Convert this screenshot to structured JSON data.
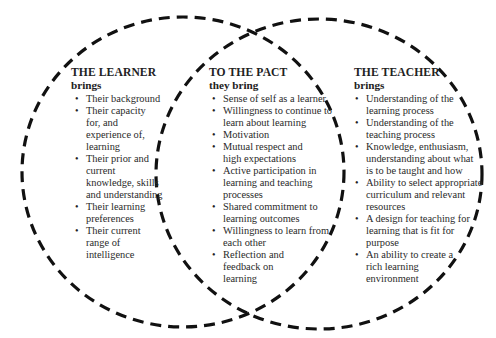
{
  "diagram": {
    "type": "venn",
    "circle_style": {
      "stroke": "#111111",
      "dash": "dashed"
    },
    "sets": [
      {
        "id": "learner",
        "title": "THE LEARNER",
        "subtitle": "brings",
        "items": [
          "Their background",
          "Their capacity for, and experience of, learning",
          "Their prior and current knowledge, skills and understanding",
          "Their learning preferences",
          "Their current range of intelligence"
        ]
      },
      {
        "id": "pact",
        "title": "TO THE PACT",
        "subtitle": "they bring",
        "items": [
          "Sense of self as a learner",
          "Willingness to continue to learn about learning",
          "Motivation",
          "Mutual respect and high expectations",
          "Active participation in learning and teaching processes",
          "Shared commitment to learning outcomes",
          "Willingness to learn from each other",
          "Reflection and feedback on learning"
        ]
      },
      {
        "id": "teacher",
        "title": "THE TEACHER",
        "subtitle": "brings",
        "items": [
          "Understanding of the learning process",
          "Understanding of the teaching process",
          "Knowledge, enthusiasm, understanding about what is to be taught and how",
          "Ability to select appropriate curriculum and relevant resources",
          "A design for teaching for learning that is fit for purpose",
          "An ability to create a rich learning environment"
        ]
      }
    ]
  }
}
